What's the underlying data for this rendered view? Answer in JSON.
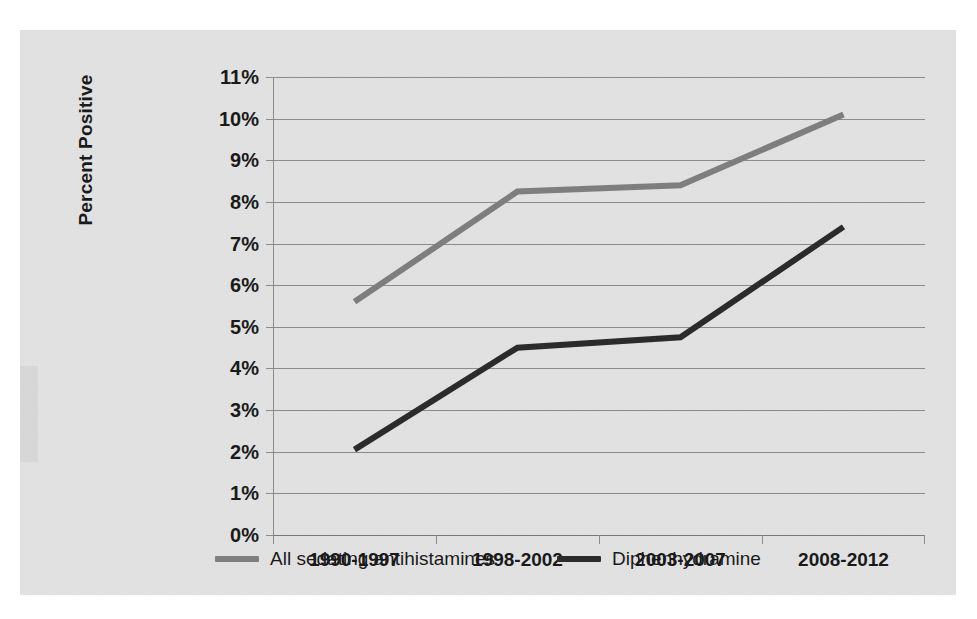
{
  "chart_data": {
    "type": "line",
    "title": "",
    "xlabel": "",
    "ylabel": "Percent Positive",
    "categories": [
      "1990-1997",
      "1998-2002",
      "2003-2007",
      "2008-2012"
    ],
    "ylim": [
      0,
      11
    ],
    "ytick_labels": [
      "0%",
      "1%",
      "2%",
      "3%",
      "4%",
      "5%",
      "6%",
      "7%",
      "8%",
      "9%",
      "10%",
      "11%"
    ],
    "ytick_values": [
      0,
      1,
      2,
      3,
      4,
      5,
      6,
      7,
      8,
      9,
      10,
      11
    ],
    "grid": true,
    "legend_position": "bottom",
    "series": [
      {
        "name": "All sedating antihistamines",
        "color": "#7f7f7f",
        "values": [
          5.6,
          8.25,
          8.4,
          10.1
        ]
      },
      {
        "name": "Diphenhydramine",
        "color": "#2b2b2b",
        "values": [
          2.05,
          4.5,
          4.75,
          7.4
        ]
      }
    ]
  },
  "colors": {
    "panel_background": "#e3e3e3",
    "page_background": "#ffffff",
    "gridline": "#8c8c8c",
    "text": "#1a1a1a",
    "series_gray": "#7f7f7f",
    "series_black": "#2b2b2b"
  }
}
